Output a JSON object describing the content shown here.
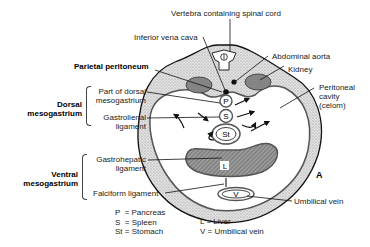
{
  "figure_label": "A",
  "labels": {
    "vertebra": "Vertebra containing spinal cord",
    "ivc": "Inferior vena cava",
    "aorta": "Abdominal aorta",
    "kidney": "Kidney",
    "parietal_peritoneum": "Parietal peritoneum",
    "peritoneal_cavity": [
      "Peritoneal",
      "cavity",
      "(celom)"
    ],
    "part_dorsal": [
      "Part of dorsal",
      "mesogastrium"
    ],
    "gastrolienal": [
      "Gastrolienal",
      "ligament"
    ],
    "gastrohepatic": [
      "Gastrohepatic",
      "ligament"
    ],
    "falciform": "Falciform ligament",
    "umbilical_vein": "Umbilical vein",
    "dorsal_group": [
      "Dorsal",
      "mesogastrium"
    ],
    "ventral_group": [
      "Ventral",
      "mesogastrium"
    ]
  },
  "organ_letters": {
    "pancreas": "P",
    "spleen": "S",
    "stomach": "St",
    "liver": "L",
    "umbilical_vein": "V"
  },
  "legend": {
    "left": [
      "P  = Pancreas",
      "S  = Spleen",
      "St = Stomach"
    ],
    "right": [
      "L = Liver",
      "V = Umbilical vein"
    ]
  },
  "colors": {
    "stipple": "#cfcfcf",
    "organ": "#8a8a8a",
    "line": "#111111"
  }
}
